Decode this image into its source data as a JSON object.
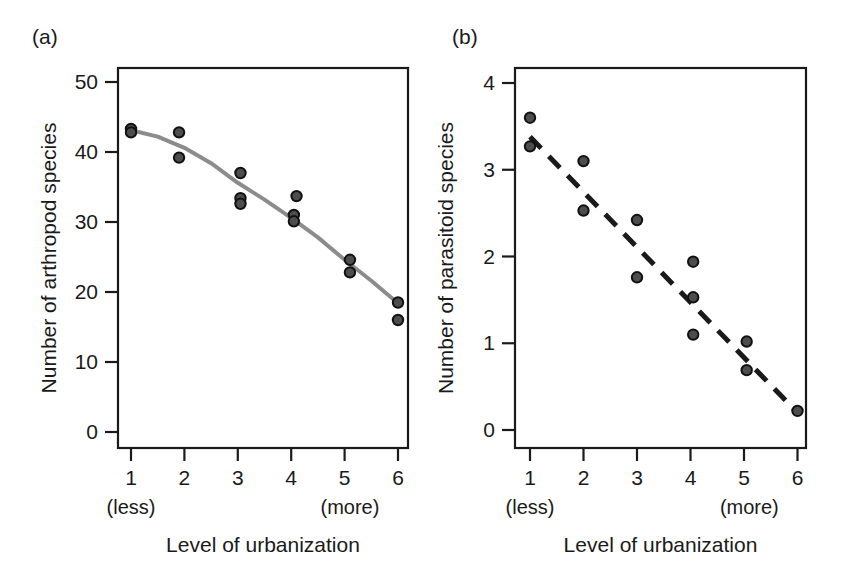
{
  "figure": {
    "background": "#ffffff",
    "ink_color": "#1a1a1a"
  },
  "panels": [
    {
      "id": "a",
      "label": "(a)"
    },
    {
      "id": "b",
      "label": "(b)"
    }
  ],
  "chart_data": [
    {
      "type": "scatter",
      "panel": "(a)",
      "title": "",
      "xlabel": "Level of urbanization",
      "ylabel": "Number of arthropod species",
      "xlim": [
        0.5,
        6.5
      ],
      "ylim": [
        0,
        52
      ],
      "xticks": [
        1,
        2,
        3,
        4,
        5,
        6
      ],
      "xtick_labels": [
        "1",
        "2",
        "3",
        "4",
        "5",
        "6"
      ],
      "yticks": [
        0,
        10,
        20,
        30,
        40,
        50
      ],
      "ytick_labels": [
        "0",
        "10",
        "20",
        "30",
        "40",
        "50"
      ],
      "x_annotations": [
        {
          "at": 1,
          "text": "(less)"
        },
        {
          "at": 5.1,
          "text": "(more)"
        }
      ],
      "grid": false,
      "legend": "none",
      "points": [
        {
          "x": 1,
          "y": 43.3
        },
        {
          "x": 1,
          "y": 42.8
        },
        {
          "x": 1.9,
          "y": 42.8
        },
        {
          "x": 1.9,
          "y": 39.2
        },
        {
          "x": 3.05,
          "y": 37.0
        },
        {
          "x": 3.05,
          "y": 33.4
        },
        {
          "x": 3.05,
          "y": 32.6
        },
        {
          "x": 4.1,
          "y": 33.7
        },
        {
          "x": 4.05,
          "y": 31.0
        },
        {
          "x": 4.05,
          "y": 30.1
        },
        {
          "x": 5.1,
          "y": 24.6
        },
        {
          "x": 5.1,
          "y": 22.8
        },
        {
          "x": 6.0,
          "y": 18.5
        },
        {
          "x": 6.0,
          "y": 16.0
        }
      ],
      "fit_line": {
        "style": "solid",
        "color": "#8c8c8c",
        "width": 4,
        "description": "smoothed curve",
        "vertices": [
          {
            "x": 1.0,
            "y": 43.1
          },
          {
            "x": 1.5,
            "y": 42.2
          },
          {
            "x": 2.0,
            "y": 40.6
          },
          {
            "x": 2.5,
            "y": 38.4
          },
          {
            "x": 3.0,
            "y": 35.6
          },
          {
            "x": 3.5,
            "y": 33.2
          },
          {
            "x": 4.0,
            "y": 30.6
          },
          {
            "x": 4.5,
            "y": 27.8
          },
          {
            "x": 5.0,
            "y": 24.6
          },
          {
            "x": 5.5,
            "y": 21.6
          },
          {
            "x": 6.0,
            "y": 18.4
          }
        ]
      }
    },
    {
      "type": "scatter",
      "panel": "(b)",
      "title": "",
      "xlabel": "Level of urbanization",
      "ylabel": "Number of parasitoid species",
      "xlim": [
        0.5,
        6.5
      ],
      "ylim": [
        0,
        4.2
      ],
      "xticks": [
        1,
        2,
        3,
        4,
        5,
        6
      ],
      "xtick_labels": [
        "1",
        "2",
        "3",
        "4",
        "5",
        "6"
      ],
      "yticks": [
        0,
        1,
        2,
        3,
        4
      ],
      "ytick_labels": [
        "0",
        "1",
        "2",
        "3",
        "4"
      ],
      "x_annotations": [
        {
          "at": 1,
          "text": "(less)"
        },
        {
          "at": 5.1,
          "text": "(more)"
        }
      ],
      "grid": false,
      "legend": "none",
      "points": [
        {
          "x": 1.0,
          "y": 3.6
        },
        {
          "x": 1.0,
          "y": 3.27
        },
        {
          "x": 2.0,
          "y": 3.1
        },
        {
          "x": 2.0,
          "y": 2.53
        },
        {
          "x": 3.0,
          "y": 2.42
        },
        {
          "x": 3.0,
          "y": 1.76
        },
        {
          "x": 4.05,
          "y": 1.94
        },
        {
          "x": 4.05,
          "y": 1.53
        },
        {
          "x": 4.05,
          "y": 1.1
        },
        {
          "x": 5.05,
          "y": 1.02
        },
        {
          "x": 5.05,
          "y": 0.69
        },
        {
          "x": 6.0,
          "y": 0.22
        }
      ],
      "fit_line": {
        "style": "dashed",
        "color": "#1a1a1a",
        "width": 5,
        "description": "dashed regression line",
        "vertices": [
          {
            "x": 1.0,
            "y": 3.38
          },
          {
            "x": 6.0,
            "y": 0.2
          }
        ]
      }
    }
  ]
}
